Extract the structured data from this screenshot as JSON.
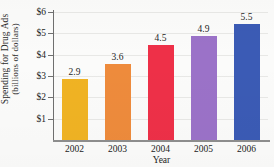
{
  "chart_data": {
    "type": "bar",
    "title": "",
    "xlabel": "Year",
    "ylabel": "Spending for Drug Ads (billions of dollars)",
    "ylabel_line1": "Spending for Drug Ads",
    "ylabel_line2": "(billions of dollars)",
    "categories": [
      "2002",
      "2003",
      "2004",
      "2005",
      "2006"
    ],
    "values": [
      2.9,
      3.6,
      4.5,
      4.9,
      5.5
    ],
    "value_labels": [
      "2.9",
      "3.6",
      "4.5",
      "4.9",
      "5.5"
    ],
    "ylim": [
      0,
      6
    ],
    "y_ticks": [
      1,
      2,
      3,
      4,
      5,
      6
    ],
    "y_tick_labels": [
      "$1",
      "$2",
      "$3",
      "$4",
      "$5",
      "$6"
    ],
    "grid": true,
    "legend": "none",
    "bar_colors": [
      "#F0B323",
      "#EE8B3C",
      "#EE3048",
      "#9B72C8",
      "#3B5BB5"
    ]
  },
  "axes": {
    "y_title_line1": "Spending for Drug Ads",
    "y_title_line2": "(billions of dollars)",
    "x_title": "Year"
  }
}
